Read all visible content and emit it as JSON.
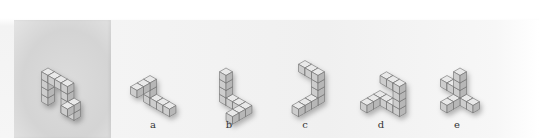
{
  "colors": {
    "top": "#e9e9e9",
    "left": "#cdcdcd",
    "right": "#b7b7b7",
    "edge": "#6d6d6d"
  },
  "reference": {
    "cubes": [
      [
        0,
        0,
        0
      ],
      [
        0,
        0,
        1
      ],
      [
        0,
        0,
        2
      ],
      [
        0,
        0,
        3
      ],
      [
        1,
        0,
        3
      ],
      [
        2,
        0,
        3
      ],
      [
        3,
        0,
        3
      ],
      [
        3,
        0,
        2
      ],
      [
        3,
        0,
        1
      ],
      [
        3,
        0,
        0
      ],
      [
        4,
        0,
        0
      ],
      [
        4,
        0,
        1
      ],
      [
        4,
        1,
        1
      ]
    ]
  },
  "options": [
    {
      "label": "a",
      "cubes": [
        [
          0,
          0,
          0
        ],
        [
          1,
          0,
          0
        ],
        [
          2,
          0,
          0
        ],
        [
          3,
          0,
          0
        ],
        [
          0,
          0,
          1
        ],
        [
          0,
          0,
          2
        ],
        [
          0,
          1,
          2
        ],
        [
          0,
          2,
          2
        ]
      ]
    },
    {
      "label": "b",
      "cubes": [
        [
          0,
          0,
          0
        ],
        [
          0,
          0,
          1
        ],
        [
          0,
          0,
          2
        ],
        [
          0,
          0,
          3
        ],
        [
          1,
          0,
          0
        ],
        [
          2,
          0,
          0
        ],
        [
          3,
          0,
          0
        ],
        [
          3,
          1,
          0
        ],
        [
          3,
          2,
          0
        ]
      ]
    },
    {
      "label": "c",
      "cubes": [
        [
          0,
          0,
          0
        ],
        [
          0,
          0,
          1
        ],
        [
          0,
          0,
          2
        ],
        [
          0,
          0,
          3
        ],
        [
          -1,
          0,
          3
        ],
        [
          -2,
          0,
          3
        ],
        [
          0,
          1,
          0
        ],
        [
          0,
          2,
          0
        ],
        [
          0,
          3,
          0
        ]
      ]
    },
    {
      "label": "d",
      "cubes": [
        [
          0,
          0,
          0
        ],
        [
          1,
          0,
          0
        ],
        [
          2,
          0,
          0
        ],
        [
          3,
          0,
          0
        ],
        [
          3,
          0,
          1
        ],
        [
          3,
          0,
          2
        ],
        [
          3,
          0,
          3
        ],
        [
          2,
          0,
          3
        ],
        [
          1,
          0,
          3
        ],
        [
          0,
          1,
          0
        ],
        [
          0,
          2,
          0
        ]
      ]
    },
    {
      "label": "e",
      "cubes": [
        [
          0,
          0,
          0
        ],
        [
          0,
          0,
          1
        ],
        [
          0,
          0,
          2
        ],
        [
          0,
          0,
          3
        ],
        [
          1,
          0,
          0
        ],
        [
          2,
          0,
          0
        ],
        [
          0,
          1,
          0
        ],
        [
          0,
          2,
          0
        ],
        [
          -1,
          0,
          1
        ],
        [
          -2,
          0,
          1
        ]
      ]
    }
  ],
  "layout": {
    "reference": {
      "x": 48,
      "y": 98
    },
    "options": [
      {
        "x": 150,
        "y": 98,
        "lx": 143
      },
      {
        "x": 226,
        "y": 98,
        "lx": 219
      },
      {
        "x": 318,
        "y": 98,
        "lx": 295
      },
      {
        "x": 380,
        "y": 98,
        "lx": 371
      },
      {
        "x": 460,
        "y": 98,
        "lx": 447
      }
    ]
  }
}
